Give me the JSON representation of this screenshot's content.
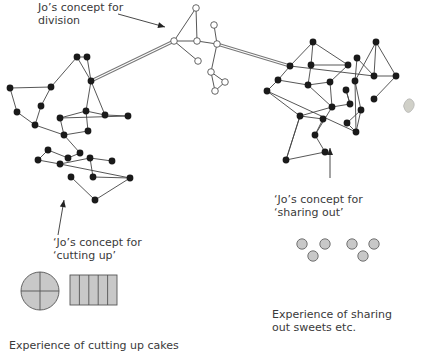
{
  "labels": {
    "division": [
      "Jo’s concept for",
      "division"
    ],
    "sharing": [
      "‘Jo’s concept for",
      "‘sharing out’"
    ],
    "cutting": [
      "‘Jo’s concept for",
      "‘cutting up’"
    ],
    "sweets": [
      "Experience of sharing",
      "out sweets etc."
    ],
    "cakes": [
      "Experience of cutting up cakes"
    ]
  },
  "colors": {
    "node_filled": "#1a1a1a",
    "node_open_stroke": "#555555",
    "edge": "#444444",
    "shape_fill": "#c8c8c8",
    "shape_stroke": "#555555",
    "text": "#3a3a3a"
  },
  "networks": {
    "division": {
      "style": "open",
      "nodes": [
        [
          196,
          8
        ],
        [
          214,
          25
        ],
        [
          174,
          41
        ],
        [
          197,
          41
        ],
        [
          217,
          44
        ],
        [
          198,
          61
        ],
        [
          211,
          72
        ],
        [
          225,
          82
        ],
        [
          215,
          91
        ]
      ],
      "edges": [
        [
          0,
          2
        ],
        [
          0,
          3
        ],
        [
          1,
          4
        ],
        [
          2,
          3
        ],
        [
          3,
          4
        ],
        [
          2,
          5
        ],
        [
          4,
          6
        ],
        [
          6,
          7
        ],
        [
          7,
          8
        ],
        [
          6,
          8
        ]
      ]
    },
    "cutting_up": {
      "style": "filled",
      "nodes": [
        [
          10,
          88
        ],
        [
          51,
          87
        ],
        [
          77,
          57
        ],
        [
          87,
          57
        ],
        [
          91,
          81
        ],
        [
          17,
          112
        ],
        [
          41,
          106
        ],
        [
          35,
          125
        ],
        [
          60,
          118
        ],
        [
          86,
          111
        ],
        [
          105,
          115
        ],
        [
          128,
          116
        ],
        [
          88,
          131
        ],
        [
          64,
          135
        ],
        [
          80,
          153
        ],
        [
          68,
          158
        ],
        [
          48,
          150
        ],
        [
          38,
          160
        ],
        [
          60,
          164
        ],
        [
          90,
          158
        ],
        [
          112,
          161
        ],
        [
          71,
          177
        ],
        [
          93,
          177
        ],
        [
          130,
          178
        ],
        [
          95,
          200
        ]
      ],
      "edges": [
        [
          0,
          1
        ],
        [
          0,
          5
        ],
        [
          5,
          7
        ],
        [
          1,
          6
        ],
        [
          6,
          7
        ],
        [
          1,
          2
        ],
        [
          2,
          3
        ],
        [
          3,
          4
        ],
        [
          2,
          4
        ],
        [
          4,
          9
        ],
        [
          4,
          10
        ],
        [
          9,
          12
        ],
        [
          10,
          11
        ],
        [
          11,
          8
        ],
        [
          10,
          9
        ],
        [
          8,
          13
        ],
        [
          9,
          8
        ],
        [
          10,
          28
        ],
        [
          12,
          13
        ],
        [
          7,
          13
        ],
        [
          13,
          14
        ],
        [
          14,
          15
        ],
        [
          15,
          16
        ],
        [
          16,
          17
        ],
        [
          17,
          18
        ],
        [
          18,
          19
        ],
        [
          19,
          20
        ],
        [
          16,
          37
        ],
        [
          18,
          23
        ],
        [
          19,
          22
        ],
        [
          22,
          23
        ],
        [
          23,
          24
        ],
        [
          24,
          21
        ],
        [
          11,
          26
        ]
      ]
    },
    "sharing_out": {
      "style": "filled",
      "nodes": [
        [
          313,
          42
        ],
        [
          311,
          65
        ],
        [
          348,
          65
        ],
        [
          290,
          66
        ],
        [
          278,
          80
        ],
        [
          267,
          91
        ],
        [
          308,
          85
        ],
        [
          330,
          82
        ],
        [
          357,
          58
        ],
        [
          376,
          42
        ],
        [
          374,
          76
        ],
        [
          355,
          81
        ],
        [
          396,
          76
        ],
        [
          374,
          99
        ],
        [
          346,
          90
        ],
        [
          350,
          104
        ],
        [
          332,
          107
        ],
        [
          300,
          116
        ],
        [
          361,
          110
        ],
        [
          347,
          123
        ],
        [
          323,
          119
        ],
        [
          356,
          132
        ],
        [
          315,
          135
        ],
        [
          325,
          152
        ],
        [
          286,
          160
        ]
      ],
      "edges": [
        [
          0,
          1
        ],
        [
          0,
          2
        ],
        [
          0,
          3
        ],
        [
          1,
          2
        ],
        [
          3,
          4
        ],
        [
          4,
          5
        ],
        [
          3,
          10
        ],
        [
          1,
          6
        ],
        [
          4,
          6
        ],
        [
          6,
          7
        ],
        [
          7,
          2
        ],
        [
          6,
          16
        ],
        [
          7,
          16
        ],
        [
          8,
          10
        ],
        [
          8,
          11
        ],
        [
          9,
          10
        ],
        [
          9,
          11
        ],
        [
          9,
          12
        ],
        [
          10,
          12
        ],
        [
          12,
          13
        ],
        [
          11,
          21
        ],
        [
          14,
          15
        ],
        [
          14,
          15
        ],
        [
          15,
          16
        ],
        [
          5,
          21
        ],
        [
          5,
          17
        ],
        [
          16,
          17
        ],
        [
          16,
          22
        ],
        [
          17,
          24
        ],
        [
          17,
          20
        ],
        [
          20,
          22
        ],
        [
          22,
          23
        ],
        [
          23,
          24
        ],
        [
          24,
          17
        ],
        [
          18,
          19
        ],
        [
          19,
          21
        ],
        [
          18,
          21
        ],
        [
          11,
          18
        ]
      ]
    }
  },
  "bridges": [
    {
      "from": [
        91,
        81
      ],
      "to": [
        174,
        41
      ]
    },
    {
      "from": [
        217,
        44
      ],
      "to": [
        290,
        66
      ]
    }
  ],
  "arrows": [
    {
      "name": "division-arrow",
      "from": [
        118,
        14
      ],
      "to": [
        165,
        27
      ]
    },
    {
      "name": "cutting-arrow",
      "from": [
        58,
        235
      ],
      "to": [
        64,
        200
      ]
    },
    {
      "name": "sharing-arrow",
      "from": [
        330,
        178
      ],
      "to": [
        330,
        148
      ]
    }
  ],
  "sweets": [
    [
      302,
      244
    ],
    [
      325,
      244
    ],
    [
      313,
      256
    ],
    [
      352,
      244
    ],
    [
      374,
      244
    ],
    [
      363,
      256
    ]
  ],
  "pie": {
    "cx": 40,
    "cy": 291,
    "r": 19
  },
  "bar": {
    "x": 70,
    "y": 275,
    "w": 47,
    "h": 30,
    "segments": 5
  }
}
